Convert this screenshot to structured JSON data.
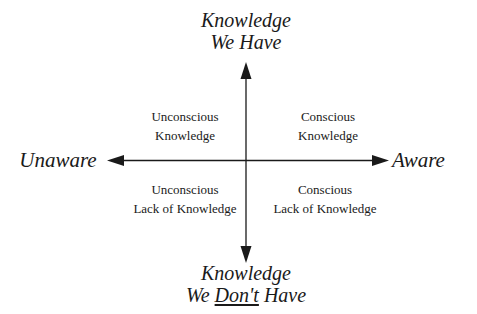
{
  "diagram": {
    "type": "quadrant",
    "axes": {
      "vertical": {
        "top": {
          "line1": "Knowledge",
          "line2": "We Have"
        },
        "bottom": {
          "line1": "Knowledge",
          "line2_prefix": "We ",
          "line2_emphasis": "Don't",
          "line2_suffix": " Have"
        }
      },
      "horizontal": {
        "left": "Unaware",
        "right": "Aware"
      }
    },
    "quadrants": {
      "top_left": {
        "line1": "Unconscious",
        "line2": "Knowledge"
      },
      "top_right": {
        "line1": "Conscious",
        "line2": "Knowledge"
      },
      "bottom_left": {
        "line1": "Unconscious",
        "line2": "Lack of Knowledge"
      },
      "bottom_right": {
        "line1": "Conscious",
        "line2": "Lack of Knowledge"
      }
    },
    "colors": {
      "ink": "#1a1a1a",
      "background": "#ffffff"
    }
  }
}
